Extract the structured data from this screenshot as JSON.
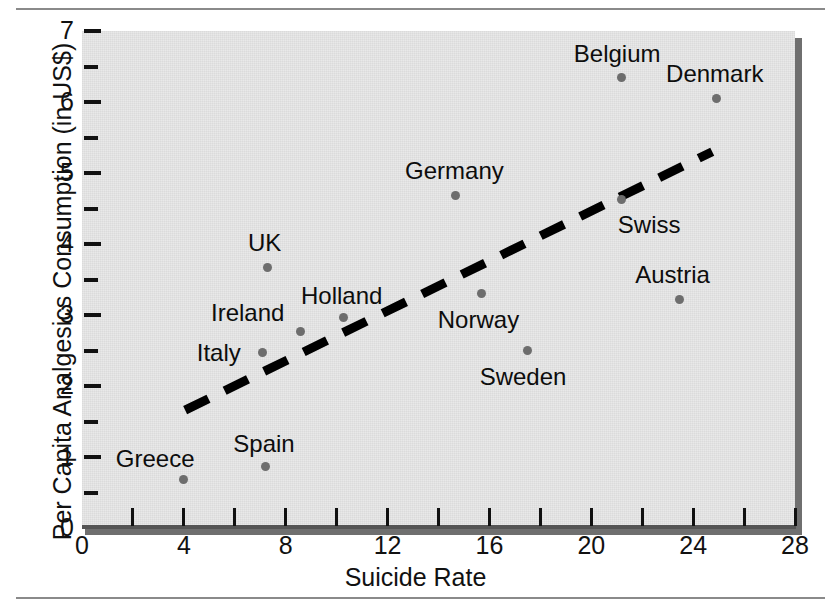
{
  "figure": {
    "background_color": "#ffffff",
    "plot_background_color": "#e9e9e9",
    "rule_color": "#8a8a8a",
    "marker_color": "#6d6d6d",
    "trend_color": "#000000"
  },
  "chart_data": {
    "type": "scatter",
    "title": "",
    "xlabel": "Suicide Rate",
    "ylabel": "Per Capita Analgesics Consumption (in US$)",
    "xlim": [
      0,
      28
    ],
    "ylim": [
      0,
      7
    ],
    "xticks": [
      0,
      4,
      8,
      12,
      16,
      20,
      24,
      28
    ],
    "yticks": [
      0,
      1,
      2,
      3,
      4,
      5,
      6,
      7
    ],
    "xminor_step": 2,
    "yminor_step": 0.5,
    "grid": false,
    "legend": null,
    "points": [
      {
        "label": "Greece",
        "x": 4.0,
        "y": 0.69,
        "label_dx": -68,
        "label_dy": -32
      },
      {
        "label": "Spain",
        "x": 7.2,
        "y": 0.87,
        "label_dx": -32,
        "label_dy": -34
      },
      {
        "label": "Italy",
        "x": 7.1,
        "y": 2.47,
        "label_dx": -66,
        "label_dy": -12
      },
      {
        "label": "UK",
        "x": 7.3,
        "y": 3.67,
        "label_dx": -20,
        "label_dy": -36
      },
      {
        "label": "Ireland",
        "x": 8.6,
        "y": 2.77,
        "label_dx": -90,
        "label_dy": -30
      },
      {
        "label": "Holland",
        "x": 10.25,
        "y": 2.96,
        "label_dx": -42,
        "label_dy": -34
      },
      {
        "label": "Germany",
        "x": 14.65,
        "y": 4.69,
        "label_dx": -50,
        "label_dy": -36
      },
      {
        "label": "Norway",
        "x": 15.7,
        "y": 3.3,
        "label_dx": -44,
        "label_dy": 14
      },
      {
        "label": "Sweden",
        "x": 17.5,
        "y": 2.5,
        "label_dx": -48,
        "label_dy": 14
      },
      {
        "label": "Belgium",
        "x": 21.2,
        "y": 6.34,
        "label_dx": -48,
        "label_dy": -36
      },
      {
        "label": "Swiss",
        "x": 21.2,
        "y": 4.63,
        "label_dx": -4,
        "label_dy": 14
      },
      {
        "label": "Austria",
        "x": 23.45,
        "y": 3.22,
        "label_dx": -44,
        "label_dy": -36
      },
      {
        "label": "Denmark",
        "x": 24.9,
        "y": 6.05,
        "label_dx": -50,
        "label_dy": -36
      }
    ],
    "trend_line": {
      "style": "dashed",
      "x_start": 4.05,
      "y_start": 1.66,
      "x_end": 24.75,
      "y_end": 5.3
    }
  },
  "axis": {
    "x_tick_labels": [
      "0",
      "4",
      "8",
      "12",
      "16",
      "20",
      "24",
      "28"
    ],
    "y_tick_labels": [
      "0",
      "1",
      "2",
      "3",
      "4",
      "5",
      "6",
      "7"
    ]
  }
}
